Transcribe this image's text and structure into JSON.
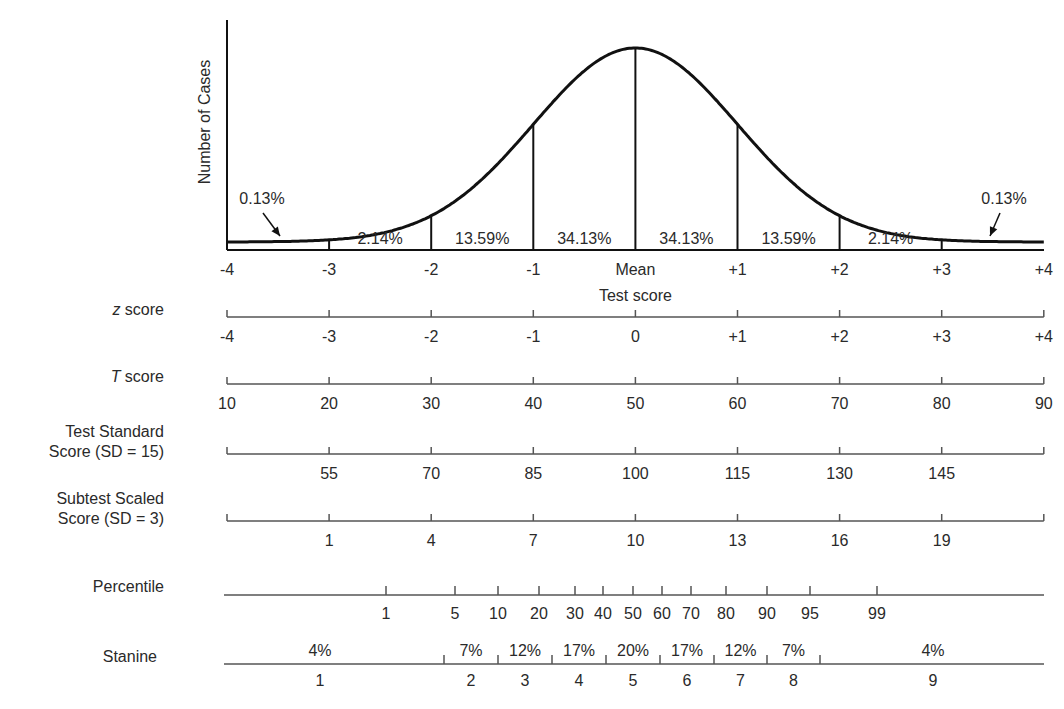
{
  "chart_data": {
    "type": "area",
    "title": "",
    "xlabel": "Test score",
    "ylabel": "Number of Cases",
    "curve": "normal distribution (bell curve)",
    "x_ticks": [
      "-4",
      "-3",
      "-2",
      "-1",
      "Mean",
      "+1",
      "+2",
      "+3",
      "+4"
    ],
    "x_tick_sd": [
      -4,
      -3,
      -2,
      -1,
      0,
      1,
      2,
      3,
      4
    ],
    "areas": [
      {
        "from": -4,
        "to": -3,
        "label": "0.13%",
        "value": 0.13,
        "arrow": true
      },
      {
        "from": -3,
        "to": -2,
        "label": "2.14%",
        "value": 2.14
      },
      {
        "from": -2,
        "to": -1,
        "label": "13.59%",
        "value": 13.59
      },
      {
        "from": -1,
        "to": 0,
        "label": "34.13%",
        "value": 34.13
      },
      {
        "from": 0,
        "to": 1,
        "label": "34.13%",
        "value": 34.13
      },
      {
        "from": 1,
        "to": 2,
        "label": "13.59%",
        "value": 13.59
      },
      {
        "from": 2,
        "to": 3,
        "label": "2.14%",
        "value": 2.14
      },
      {
        "from": 3,
        "to": 4,
        "label": "0.13%",
        "value": 0.13,
        "arrow": true
      }
    ],
    "scales": [
      {
        "name": "z score",
        "italic_prefix": "z",
        "suffix": " score",
        "ticks": [
          "-4",
          "-3",
          "-2",
          "-1",
          "0",
          "+1",
          "+2",
          "+3",
          "+4"
        ]
      },
      {
        "name": "T score",
        "italic_prefix": "T",
        "suffix": " score",
        "ticks": [
          "10",
          "20",
          "30",
          "40",
          "50",
          "60",
          "70",
          "80",
          "90"
        ]
      },
      {
        "name": "Test Standard Score (SD = 15)",
        "line1": "Test Standard",
        "line2": "Score (SD = 15)",
        "ticks": [
          "",
          "55",
          "70",
          "85",
          "100",
          "115",
          "130",
          "145",
          ""
        ]
      },
      {
        "name": "Subtest Scaled Score (SD = 3)",
        "line1": "Subtest Scaled",
        "line2": "Score (SD = 3)",
        "ticks": [
          "",
          "1",
          "4",
          "7",
          "10",
          "13",
          "16",
          "19",
          ""
        ]
      }
    ],
    "percentile": {
      "name": "Percentile",
      "ticks": [
        {
          "label": "1",
          "x": 386
        },
        {
          "label": "5",
          "x": 455
        },
        {
          "label": "10",
          "x": 498
        },
        {
          "label": "20",
          "x": 539
        },
        {
          "label": "30",
          "x": 575
        },
        {
          "label": "40",
          "x": 603
        },
        {
          "label": "50",
          "x": 633
        },
        {
          "label": "60",
          "x": 662
        },
        {
          "label": "70",
          "x": 691
        },
        {
          "label": "80",
          "x": 726
        },
        {
          "label": "90",
          "x": 767
        },
        {
          "label": "95",
          "x": 810
        },
        {
          "label": "99",
          "x": 877
        }
      ]
    },
    "stanine": {
      "name": "Stanine",
      "boundaries": [
        444,
        498,
        552,
        606,
        660,
        714,
        767,
        820
      ],
      "bands": [
        {
          "stanine": "1",
          "pct": "4%"
        },
        {
          "stanine": "2",
          "pct": "7%"
        },
        {
          "stanine": "3",
          "pct": "12%"
        },
        {
          "stanine": "4",
          "pct": "17%"
        },
        {
          "stanine": "5",
          "pct": "20%"
        },
        {
          "stanine": "6",
          "pct": "17%"
        },
        {
          "stanine": "7",
          "pct": "12%"
        },
        {
          "stanine": "8",
          "pct": "7%"
        },
        {
          "stanine": "9",
          "pct": "4%"
        }
      ]
    },
    "layout": {
      "x_left": 227,
      "x_right": 1044,
      "baseline_y": 250,
      "peak_y": 48,
      "sd_px": 102.1,
      "grid": false,
      "legend": "none"
    }
  }
}
